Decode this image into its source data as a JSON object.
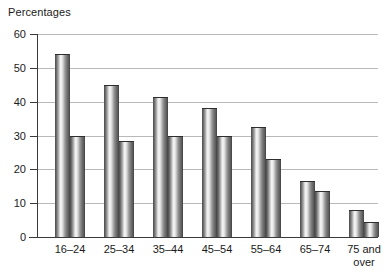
{
  "chart_data": {
    "type": "bar",
    "title": "Percentages",
    "xlabel": "",
    "ylabel": "Percentages",
    "ylim": [
      0,
      60
    ],
    "yticks": [
      0,
      10,
      20,
      30,
      40,
      50,
      60
    ],
    "grid": true,
    "legend": "none",
    "categories": [
      "16–24",
      "25–34",
      "35–44",
      "45–54",
      "55–64",
      "65–74",
      "75 and\nover"
    ],
    "series": [
      {
        "name": "Series 1",
        "values": [
          54,
          45,
          41.5,
          38,
          32.5,
          16.5,
          8
        ]
      },
      {
        "name": "Series 2",
        "values": [
          30,
          28.5,
          30,
          30,
          23,
          13.5,
          4.5
        ]
      }
    ]
  },
  "chart": {
    "axis_title": "Percentages",
    "y_tick_labels": [
      "60",
      "50",
      "40",
      "30",
      "20",
      "10",
      "0"
    ],
    "category_labels": [
      "16–24",
      "25–34",
      "35–44",
      "45–54",
      "55–64",
      "65–74",
      "75 and\nover"
    ]
  }
}
